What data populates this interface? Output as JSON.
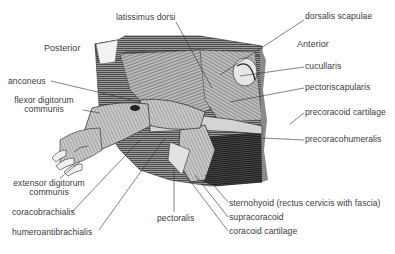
{
  "diagram": {
    "orientation": {
      "posterior": "Posterior",
      "anterior": "Anterior"
    },
    "labels": [
      {
        "id": "latissimus-dorsi",
        "text": "latissimus dorsi",
        "x": 116,
        "y": 17
      },
      {
        "id": "dorsalis-scapulae",
        "text": "dorsalis scapulae",
        "x": 305,
        "y": 16
      },
      {
        "id": "anterior",
        "text": "Anterior",
        "x": 297,
        "y": 44
      },
      {
        "id": "posterior",
        "text": "Posterior",
        "x": 44,
        "y": 47
      },
      {
        "id": "cucullaris",
        "text": "cucullaris",
        "x": 305,
        "y": 63
      },
      {
        "id": "pectoriscapularis",
        "text": "pectoriscapularis",
        "x": 305,
        "y": 84
      },
      {
        "id": "anconeus",
        "text": "anconeus",
        "x": 8,
        "y": 79
      },
      {
        "id": "flexor-digitorum-communis",
        "text": "flexor digitorum",
        "text2": "communis",
        "x": 8,
        "y": 98
      },
      {
        "id": "precoracoid-cartilage",
        "text": "precoracoid cartilage",
        "x": 305,
        "y": 109
      },
      {
        "id": "precoracohumeralis",
        "text": "precoracohumeralis",
        "x": 305,
        "y": 136
      },
      {
        "id": "extensor-digitorum-communis",
        "text": "extensor digitorum",
        "text2": "communis",
        "x": 10,
        "y": 179
      },
      {
        "id": "sternohyoid",
        "text": "sternohyoid (rectus cervicis with fascia)",
        "x": 229,
        "y": 200
      },
      {
        "id": "coracobrachialis",
        "text": "coracobrachialis",
        "x": 12,
        "y": 209
      },
      {
        "id": "pectoralis",
        "text": "pectoralis",
        "x": 157,
        "y": 215
      },
      {
        "id": "supracoracoid",
        "text": "supracoracoid",
        "x": 229,
        "y": 214
      },
      {
        "id": "humeroantibrachialis",
        "text": "humeroantibrachialis",
        "x": 12,
        "y": 229
      },
      {
        "id": "coracoid-cartilage",
        "text": "coracoid cartilage",
        "x": 229,
        "y": 228
      }
    ]
  }
}
